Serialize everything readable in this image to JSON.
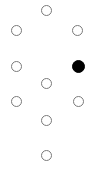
{
  "colors": {
    "background": "#ffffff",
    "unselected_stroke": "#7a7a7a",
    "selected_fill": "#000000"
  },
  "options": [
    {
      "id": "top",
      "cx": 46,
      "cy": 10,
      "selected": false
    },
    {
      "id": "upper-left",
      "cx": 16,
      "cy": 30,
      "selected": false
    },
    {
      "id": "upper-right",
      "cx": 77,
      "cy": 30,
      "selected": false
    },
    {
      "id": "middle-left",
      "cx": 16,
      "cy": 66,
      "selected": false
    },
    {
      "id": "middle-right",
      "cx": 78,
      "cy": 66,
      "selected": true
    },
    {
      "id": "center",
      "cx": 46,
      "cy": 83,
      "selected": false
    },
    {
      "id": "lower-left",
      "cx": 16,
      "cy": 101,
      "selected": false
    },
    {
      "id": "lower-right",
      "cx": 78,
      "cy": 101,
      "selected": false
    },
    {
      "id": "lower-center",
      "cx": 46,
      "cy": 120,
      "selected": false
    },
    {
      "id": "bottom",
      "cx": 46,
      "cy": 155,
      "selected": false
    }
  ]
}
